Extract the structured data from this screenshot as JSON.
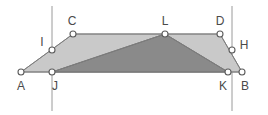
{
  "figure": {
    "canvas": {
      "width": 268,
      "height": 115,
      "background": "#ffffff"
    },
    "colors": {
      "light_fill": "#c9c9c9",
      "dark_fill": "#8a8a8a",
      "stroke": "#7d7d7d",
      "guide_line": "#9a9a9a",
      "vertex_fill": "#ffffff",
      "vertex_stroke": "#5d5d5d",
      "label_color": "#4a4a4a"
    },
    "points": [
      {
        "id": "A",
        "label": "A",
        "x": 21,
        "y": 72,
        "label_x": 21,
        "label_y": 86
      },
      {
        "id": "B",
        "label": "B",
        "x": 242,
        "y": 72,
        "label_x": 245,
        "label_y": 86
      },
      {
        "id": "C",
        "label": "C",
        "x": 73,
        "y": 34,
        "label_x": 72,
        "label_y": 21
      },
      {
        "id": "D",
        "label": "D",
        "x": 220,
        "y": 34,
        "label_x": 220,
        "label_y": 21
      },
      {
        "id": "H",
        "label": "H",
        "x": 232,
        "y": 50,
        "label_x": 244,
        "label_y": 45
      },
      {
        "id": "I",
        "label": "I",
        "x": 52,
        "y": 50,
        "label_x": 42,
        "label_y": 42
      },
      {
        "id": "J",
        "label": "J",
        "x": 52,
        "y": 72,
        "label_x": 55,
        "label_y": 86
      },
      {
        "id": "K",
        "label": "K",
        "x": 228,
        "y": 72,
        "label_x": 223,
        "label_y": 86
      },
      {
        "id": "L",
        "label": "L",
        "x": 165,
        "y": 34,
        "label_x": 165,
        "label_y": 21
      }
    ],
    "guide_lines": [
      {
        "id": "left-guide",
        "x": 52,
        "y1": 6,
        "y2": 111
      },
      {
        "id": "right-guide",
        "x": 232,
        "y1": 6,
        "y2": 111
      }
    ],
    "shapes": [
      {
        "id": "light-hexagon",
        "name": "hexagon-ACDBKJ",
        "vertices": [
          "A",
          "C",
          "D",
          "B"
        ],
        "path": "21,72 73,34 220,34 242,72",
        "fill": "#c9c9c9"
      },
      {
        "id": "dark-triangle",
        "name": "triangle-JLK",
        "vertices": [
          "J",
          "L",
          "K"
        ],
        "path": "52,72 165,34 228,72",
        "fill": "#8a8a8a"
      }
    ],
    "segments": [
      {
        "id": "seg-A-B",
        "from": "A",
        "to": "B"
      },
      {
        "id": "seg-C-D",
        "from": "C",
        "to": "D"
      },
      {
        "id": "seg-A-C",
        "from": "A",
        "to": "C"
      },
      {
        "id": "seg-D-B",
        "from": "D",
        "to": "B"
      },
      {
        "id": "seg-J-L",
        "from": "J",
        "to": "L"
      },
      {
        "id": "seg-L-K",
        "from": "L",
        "to": "K"
      }
    ]
  }
}
